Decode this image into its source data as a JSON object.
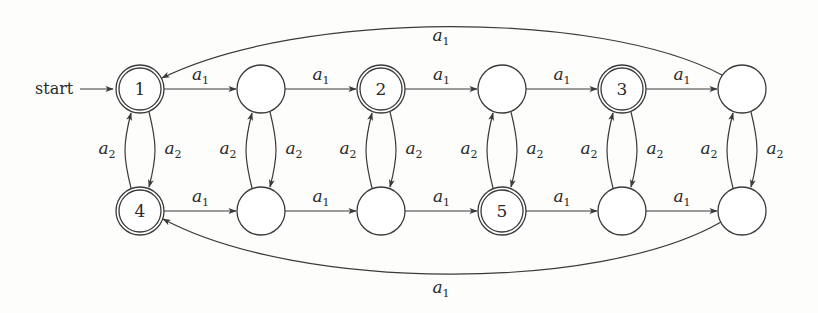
{
  "diagram": {
    "type": "finite automaton",
    "start_label": "start",
    "start_state": "q1",
    "nodes": [
      {
        "id": "q1",
        "label": "1",
        "accepting": true,
        "x": 140,
        "y": 89
      },
      {
        "id": "t2",
        "label": "",
        "accepting": false,
        "x": 261,
        "y": 89
      },
      {
        "id": "q2",
        "label": "2",
        "accepting": true,
        "x": 381,
        "y": 89
      },
      {
        "id": "t4",
        "label": "",
        "accepting": false,
        "x": 502,
        "y": 89
      },
      {
        "id": "q3",
        "label": "3",
        "accepting": true,
        "x": 622,
        "y": 89
      },
      {
        "id": "t6",
        "label": "",
        "accepting": false,
        "x": 742,
        "y": 89
      },
      {
        "id": "q4",
        "label": "4",
        "accepting": true,
        "x": 140,
        "y": 211
      },
      {
        "id": "b2",
        "label": "",
        "accepting": false,
        "x": 261,
        "y": 211
      },
      {
        "id": "b3",
        "label": "",
        "accepting": false,
        "x": 381,
        "y": 211
      },
      {
        "id": "q5",
        "label": "5",
        "accepting": true,
        "x": 502,
        "y": 211
      },
      {
        "id": "b5",
        "label": "",
        "accepting": false,
        "x": 622,
        "y": 211
      },
      {
        "id": "b6",
        "label": "",
        "accepting": false,
        "x": 742,
        "y": 211
      }
    ],
    "edges": [
      {
        "from": "q1",
        "to": "t2",
        "label": "a1"
      },
      {
        "from": "t2",
        "to": "q2",
        "label": "a1"
      },
      {
        "from": "q2",
        "to": "t4",
        "label": "a1"
      },
      {
        "from": "t4",
        "to": "q3",
        "label": "a1"
      },
      {
        "from": "q3",
        "to": "t6",
        "label": "a1"
      },
      {
        "from": "t6",
        "to": "q1",
        "label": "a1"
      },
      {
        "from": "q4",
        "to": "b2",
        "label": "a1"
      },
      {
        "from": "b2",
        "to": "b3",
        "label": "a1"
      },
      {
        "from": "b3",
        "to": "q5",
        "label": "a1"
      },
      {
        "from": "q5",
        "to": "b5",
        "label": "a1"
      },
      {
        "from": "b5",
        "to": "b6",
        "label": "a1"
      },
      {
        "from": "b6",
        "to": "q4",
        "label": "a1"
      },
      {
        "from": "q1",
        "to": "q4",
        "label": "a2"
      },
      {
        "from": "q4",
        "to": "q1",
        "label": "a2"
      },
      {
        "from": "t2",
        "to": "b2",
        "label": "a2"
      },
      {
        "from": "b2",
        "to": "t2",
        "label": "a2"
      },
      {
        "from": "q2",
        "to": "b3",
        "label": "a2"
      },
      {
        "from": "b3",
        "to": "q2",
        "label": "a2"
      },
      {
        "from": "t4",
        "to": "q5",
        "label": "a2"
      },
      {
        "from": "q5",
        "to": "t4",
        "label": "a2"
      },
      {
        "from": "q3",
        "to": "b5",
        "label": "a2"
      },
      {
        "from": "b5",
        "to": "q3",
        "label": "a2"
      },
      {
        "from": "t6",
        "to": "b6",
        "label": "a2"
      },
      {
        "from": "b6",
        "to": "t6",
        "label": "a2"
      }
    ],
    "symbols": {
      "a1_base": "a",
      "a1_sub": "1",
      "a2_base": "a",
      "a2_sub": "2"
    }
  }
}
